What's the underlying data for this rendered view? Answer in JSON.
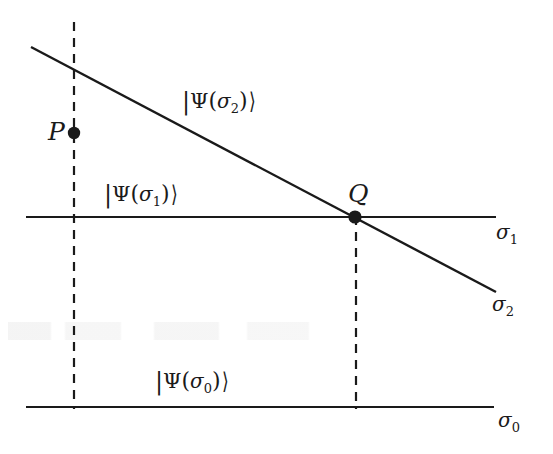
{
  "figure": {
    "domain": "Diagram",
    "background_color": "#ffffff",
    "ink_color": "#1a1a1a"
  },
  "labels": {
    "state_sigma2": {
      "bar": "|",
      "psi": "Ψ",
      "open_paren": "(",
      "sigma": "σ",
      "sub": "2",
      "close_paren": ")",
      "angle": "⟩",
      "text": "|Ψ(σ₂)⟩",
      "x": 182,
      "y": 88
    },
    "state_sigma1": {
      "bar": "|",
      "psi": "Ψ",
      "open_paren": "(",
      "sigma": "σ",
      "sub": "1",
      "close_paren": ")",
      "angle": "⟩",
      "text": "|Ψ(σ₁)⟩",
      "x": 104,
      "y": 181
    },
    "state_sigma0": {
      "bar": "|",
      "psi": "Ψ",
      "open_paren": "(",
      "sigma": "σ",
      "sub": "0",
      "close_paren": ")",
      "angle": "⟩",
      "text": "|Ψ(σ₀)⟩",
      "x": 155,
      "y": 368
    },
    "point_p": {
      "text": "P",
      "x": 48,
      "y": 119
    },
    "point_q": {
      "text": "Q",
      "x": 348,
      "y": 181
    },
    "axis_sigma1": {
      "sigma": "σ",
      "sub": "1",
      "text": "σ₁",
      "x": 496,
      "y": 222
    },
    "axis_sigma2": {
      "sigma": "σ",
      "sub": "2",
      "text": "σ₂",
      "x": 492,
      "y": 294
    },
    "axis_sigma0": {
      "sigma": "σ",
      "sub": "0",
      "text": "σ₀",
      "x": 498,
      "y": 410
    }
  },
  "geometry": {
    "hypersurface_sigma1": {
      "x1": 26,
      "y1": 217,
      "x2": 496,
      "y2": 217,
      "style": "solid",
      "width": 2.0
    },
    "hypersurface_sigma0": {
      "x1": 26,
      "y1": 407,
      "x2": 494,
      "y2": 407,
      "style": "solid",
      "width": 2.0
    },
    "hypersurface_sigma2": {
      "x1": 31,
      "y1": 47,
      "x2": 496,
      "y2": 292,
      "style": "solid",
      "width": 2.4
    },
    "worldline_p": {
      "x1": 74,
      "y1": 22,
      "x2": 74,
      "y2": 409,
      "style": "dashed",
      "width": 2.2,
      "dash": "9 7"
    },
    "worldline_q": {
      "x1": 356,
      "y1": 216,
      "x2": 356,
      "y2": 409,
      "style": "dashed",
      "width": 2.2,
      "dash": "9 7"
    },
    "point_p_marker": {
      "cx": 74,
      "cy": 133,
      "r": 6.2
    },
    "point_q_marker": {
      "cx": 355,
      "cy": 217,
      "r": 6.6
    }
  }
}
